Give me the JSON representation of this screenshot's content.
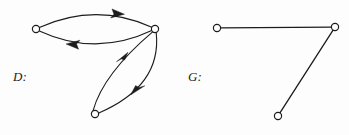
{
  "figure": {
    "width": 349,
    "height": 135,
    "background_color": "#fdfdfd",
    "stroke_color": "#1c1c1c",
    "vertex_fill_color": "#ffffff",
    "vertex_radius": 3.6,
    "stroke_width": 1.1
  },
  "graphs": [
    {
      "id": "D",
      "label": "D:",
      "type": "directed",
      "vertices": [
        {
          "id": "d1",
          "name": "left-vertex",
          "x": 36,
          "y": 29
        },
        {
          "id": "d2",
          "name": "right-vertex",
          "x": 155,
          "y": 29
        },
        {
          "id": "d3",
          "name": "bottom-vertex",
          "x": 95,
          "y": 114
        }
      ],
      "edges": [
        {
          "id": "d-e1",
          "name": "edge-left-to-right-upper",
          "from": "d1",
          "to": "d2",
          "curve": "upper-arc",
          "arrow_at": {
            "x": 118,
            "y": 12
          },
          "arrow_direction": "right"
        },
        {
          "id": "d-e2",
          "name": "edge-right-to-left-lower",
          "from": "d2",
          "to": "d1",
          "curve": "lower-arc",
          "arrow_at": {
            "x": 73,
            "y": 46
          },
          "arrow_direction": "left"
        },
        {
          "id": "d-e3",
          "name": "edge-bottom-to-right-left-arc",
          "from": "d3",
          "to": "d2",
          "curve": "left-arc",
          "arrow_at": {
            "x": 122,
            "y": 58
          },
          "arrow_direction": "up-right"
        },
        {
          "id": "d-e4",
          "name": "edge-right-to-bottom-right-arc",
          "from": "d2",
          "to": "d3",
          "curve": "right-arc",
          "arrow_at": {
            "x": 137,
            "y": 90
          },
          "arrow_direction": "down-left"
        }
      ]
    },
    {
      "id": "G",
      "label": "G:",
      "type": "undirected",
      "vertices": [
        {
          "id": "g1",
          "name": "left-vertex",
          "x": 217,
          "y": 28
        },
        {
          "id": "g2",
          "name": "right-vertex",
          "x": 335,
          "y": 27
        },
        {
          "id": "g3",
          "name": "bottom-vertex",
          "x": 278,
          "y": 116
        }
      ],
      "edges": [
        {
          "id": "g-e1",
          "name": "edge-left-right",
          "from": "g1",
          "to": "g2",
          "curve": "straight"
        },
        {
          "id": "g-e2",
          "name": "edge-right-bottom",
          "from": "g2",
          "to": "g3",
          "curve": "straight"
        }
      ]
    }
  ]
}
